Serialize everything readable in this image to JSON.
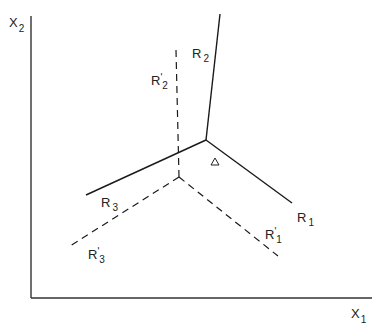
{
  "diagram": {
    "type": "intersecting-lines-phase-diagram",
    "axes": {
      "x_label": "X",
      "x_sub": "1",
      "y_label": "X",
      "y_sub": "2",
      "color": "#333333"
    },
    "solid_lines": {
      "style": "solid",
      "color": "#1a1a1a",
      "vertex": [
        206,
        140
      ],
      "rays": [
        {
          "name": "R",
          "sub": "1",
          "prime": "",
          "end": [
            292,
            203
          ],
          "label_pos": [
            297,
            220
          ]
        },
        {
          "name": "R",
          "sub": "2",
          "prime": "",
          "end": [
            220,
            14
          ],
          "label_pos": [
            192,
            58
          ]
        },
        {
          "name": "R",
          "sub": "3",
          "prime": "",
          "end": [
            86,
            195
          ],
          "label_pos": [
            101,
            205
          ]
        }
      ]
    },
    "dashed_lines": {
      "style": "dashed",
      "color": "#1a1a1a",
      "vertex": [
        179,
        177
      ],
      "rays": [
        {
          "name": "R",
          "sub": "1",
          "prime": "'",
          "end": [
            278,
            256
          ],
          "label_pos": [
            265,
            237
          ]
        },
        {
          "name": "R",
          "sub": "2",
          "prime": "'",
          "end": [
            176,
            50
          ],
          "label_pos": [
            151,
            83
          ]
        },
        {
          "name": "R",
          "sub": "3",
          "prime": "'",
          "end": [
            70,
            246
          ],
          "label_pos": [
            88,
            256
          ]
        }
      ]
    },
    "marker": {
      "shape": "triangle",
      "symbol": "△",
      "pos": [
        215,
        162
      ]
    }
  }
}
